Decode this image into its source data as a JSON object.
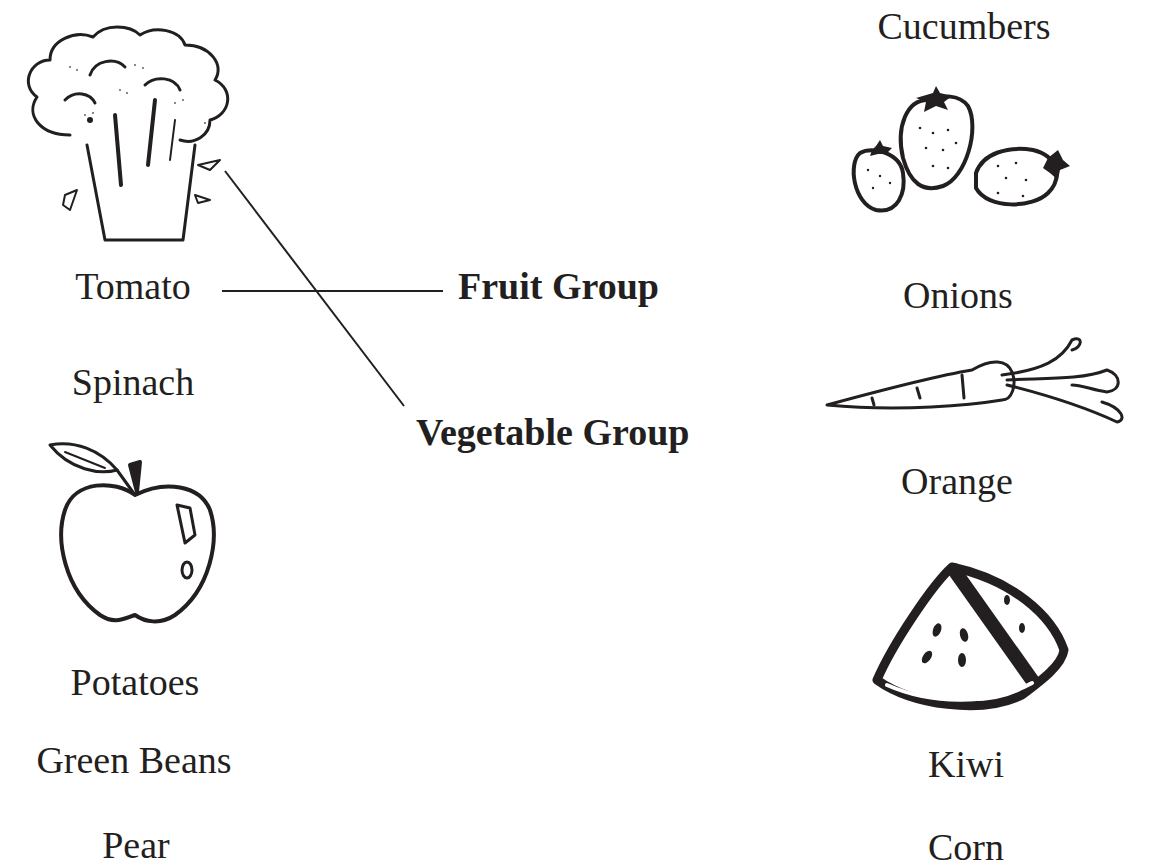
{
  "left_column": {
    "items": [
      {
        "label": "Tomato",
        "type": "text"
      },
      {
        "label": "Spinach",
        "type": "text"
      },
      {
        "label": "Potatoes",
        "type": "text"
      },
      {
        "label": "Green Beans",
        "type": "text"
      },
      {
        "label": "Pear",
        "type": "text"
      }
    ],
    "images": [
      {
        "icon": "broccoli-icon"
      },
      {
        "icon": "apple-icon"
      }
    ]
  },
  "center": {
    "groups": [
      {
        "label": "Fruit Group"
      },
      {
        "label": "Vegetable Group"
      }
    ]
  },
  "right_column": {
    "items": [
      {
        "label": "Cucumbers",
        "type": "text"
      },
      {
        "label": "Onions",
        "type": "text"
      },
      {
        "label": "Orange",
        "type": "text"
      },
      {
        "label": "Kiwi",
        "type": "text"
      },
      {
        "label": "Corn",
        "type": "text"
      }
    ],
    "images": [
      {
        "icon": "strawberries-icon"
      },
      {
        "icon": "carrot-icon"
      },
      {
        "icon": "watermelon-icon"
      }
    ]
  },
  "connections": [
    {
      "from": "Tomato",
      "to": "Fruit Group"
    },
    {
      "from": "broccoli",
      "to": "Vegetable Group"
    }
  ],
  "colors": {
    "ink": "#231f20",
    "background": "#ffffff"
  }
}
